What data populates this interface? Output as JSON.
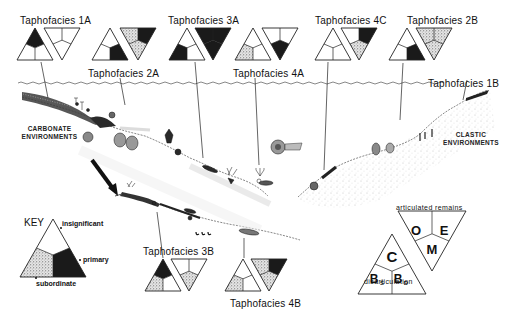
{
  "figure": {
    "taphofacies": [
      {
        "id": "1A",
        "label": "Taphofacies  1A",
        "upright": {
          "top": "primary",
          "left": "insignificant",
          "right": "insignificant"
        },
        "inverted": {
          "left": "insignificant",
          "right": "insignificant",
          "bottom": "insignificant"
        }
      },
      {
        "id": "2A",
        "label": "Taphofacies  2A",
        "upright": {
          "top": "insignificant",
          "left": "insignificant",
          "right": "primary"
        },
        "inverted": {
          "left": "subordinate",
          "right": "primary",
          "bottom": "subordinate"
        }
      },
      {
        "id": "3A",
        "label": "Taphofacies  3A",
        "upright": {
          "top": "insignificant",
          "left": "primary",
          "right": "insignificant"
        },
        "inverted": {
          "left": "primary",
          "right": "primary",
          "bottom": "primary"
        }
      },
      {
        "id": "4A",
        "label": "Taphofacies  4A",
        "upright": {
          "top": "insignificant",
          "left": "subordinate",
          "right": "insignificant"
        },
        "inverted": {
          "left": "insignificant",
          "right": "insignificant",
          "bottom": "primary"
        }
      },
      {
        "id": "4C",
        "label": "Taphofacies  4C",
        "upright": {
          "top": "insignificant",
          "left": "insignificant",
          "right": "insignificant"
        },
        "inverted": {
          "left": "insignificant",
          "right": "primary",
          "bottom": "subordinate"
        }
      },
      {
        "id": "2B",
        "label": "Taphofacies  2B",
        "upright": {
          "top": "insignificant",
          "left": "insignificant",
          "right": "primary"
        },
        "inverted": {
          "left": "subordinate",
          "right": "subordinate",
          "bottom": "subordinate"
        }
      },
      {
        "id": "1B",
        "label": "Taphofacies  1B"
      },
      {
        "id": "3B",
        "label": "Taphofacies  3B",
        "upright": {
          "top": "primary",
          "left": "subordinate",
          "right": "insignificant"
        },
        "inverted": {
          "left": "insignificant",
          "right": "insignificant",
          "bottom": "subordinate"
        }
      },
      {
        "id": "4B",
        "label": "Taphofacies  4B",
        "upright": {
          "top": "insignificant",
          "left": "subordinate",
          "right": "insignificant"
        },
        "inverted": {
          "left": "subordinate",
          "right": "primary",
          "bottom": "subordinate"
        }
      }
    ],
    "environments": {
      "carbonate": [
        "CARBONATE",
        "ENVIRONMENTS"
      ],
      "clastic": [
        "CLASTIC",
        "ENVIRONMENTS"
      ]
    },
    "key": {
      "title": "KEY",
      "insignificant": "insignificant",
      "primary": "primary",
      "subordinate": "subordinate"
    },
    "classification": {
      "top_label": "articulated remains",
      "bottom_label": "disarticulation",
      "C": "C",
      "O": "O",
      "E": "E",
      "M": "M",
      "Bs_main": "B",
      "Bs_sub": "S",
      "Bd_main": "B",
      "Bd_sub": "D"
    },
    "colors": {
      "ink": "#111111",
      "primary": "#1a1a1a",
      "subordinate": "#c8c8c8",
      "insignificant": "#ffffff"
    }
  }
}
